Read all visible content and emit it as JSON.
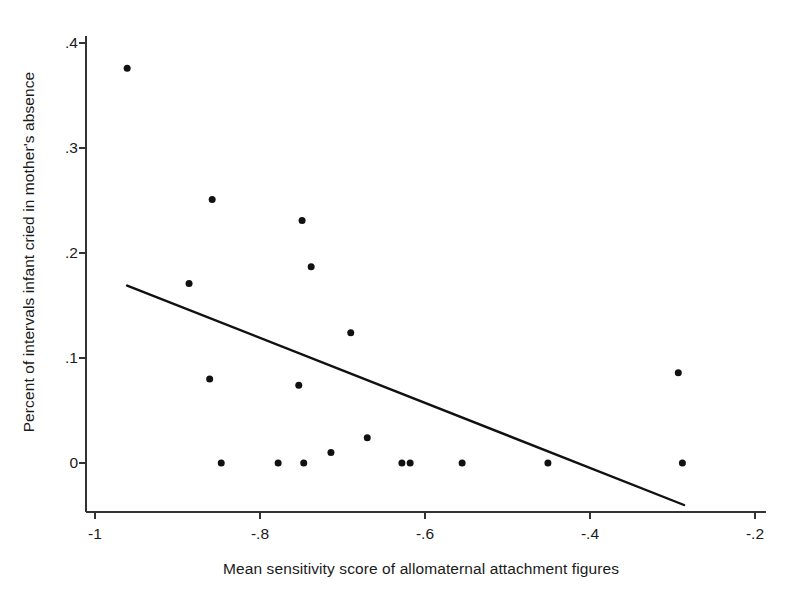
{
  "chart_data": {
    "type": "scatter",
    "title": "",
    "xlabel": "Mean sensitivity score of allomaternal attachment figures",
    "ylabel": "Percent of intervals infant cried in mother's absence",
    "xlim": [
      -1.06,
      -0.155
    ],
    "ylim": [
      -0.048,
      0.44
    ],
    "xticks": [
      -1,
      -0.8,
      -0.6,
      -0.4,
      -0.2
    ],
    "xtick_labels": [
      "-1",
      "-.8",
      "-.6",
      "-.4",
      "-.2"
    ],
    "yticks": [
      0,
      0.1,
      0.2,
      0.3,
      0.4
    ],
    "ytick_labels": [
      "0",
      ".1",
      ".2",
      ".3",
      ".4"
    ],
    "grid": false,
    "legend": "none",
    "marker": {
      "shape": "circle",
      "color": "#111111",
      "size_px": 7
    },
    "points": [
      {
        "x": -0.961,
        "y": 0.376
      },
      {
        "x": -0.886,
        "y": 0.171
      },
      {
        "x": -0.861,
        "y": 0.08
      },
      {
        "x": -0.858,
        "y": 0.251
      },
      {
        "x": -0.847,
        "y": 0.0
      },
      {
        "x": -0.778,
        "y": 0.0
      },
      {
        "x": -0.753,
        "y": 0.074
      },
      {
        "x": -0.749,
        "y": 0.231
      },
      {
        "x": -0.747,
        "y": 0.0
      },
      {
        "x": -0.738,
        "y": 0.187
      },
      {
        "x": -0.714,
        "y": 0.01
      },
      {
        "x": -0.69,
        "y": 0.124
      },
      {
        "x": -0.67,
        "y": 0.024
      },
      {
        "x": -0.628,
        "y": 0.0
      },
      {
        "x": -0.618,
        "y": 0.0
      },
      {
        "x": -0.555,
        "y": 0.0
      },
      {
        "x": -0.451,
        "y": 0.0
      },
      {
        "x": -0.293,
        "y": 0.086
      },
      {
        "x": -0.288,
        "y": 0.0
      }
    ],
    "fit_line": {
      "kind": "linear-regression",
      "color": "#111111",
      "width_px": 2.4,
      "x_start": -0.961,
      "y_start": 0.169,
      "x_end": -0.286,
      "y_end": -0.04
    },
    "axes": {
      "line_color": "#333333",
      "line_width_px": 2,
      "tick_length_px": 7,
      "spines": [
        "left",
        "bottom"
      ]
    }
  }
}
